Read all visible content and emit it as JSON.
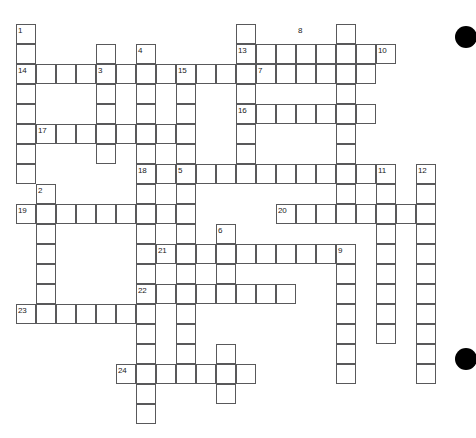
{
  "puzzle": {
    "title": "Crossword Grid",
    "cell_size": 20,
    "origin_x": 16,
    "origin_y": 24,
    "grid_color": "#59595b",
    "cell_fill": "#ffffff",
    "background": "#ffffff",
    "number_color": "#1a1a1a",
    "cols": 23,
    "rows": 20,
    "cells": [
      {
        "c": 1,
        "r": 1
      },
      {
        "c": 1,
        "r": 2
      },
      {
        "c": 1,
        "r": 3
      },
      {
        "c": 1,
        "r": 4
      },
      {
        "c": 1,
        "r": 5
      },
      {
        "c": 1,
        "r": 6
      },
      {
        "c": 1,
        "r": 7
      },
      {
        "c": 1,
        "r": 8
      },
      {
        "c": 2,
        "r": 3
      },
      {
        "c": 3,
        "r": 3
      },
      {
        "c": 4,
        "r": 3
      },
      {
        "c": 5,
        "r": 3
      },
      {
        "c": 6,
        "r": 3
      },
      {
        "c": 7,
        "r": 3
      },
      {
        "c": 8,
        "r": 3
      },
      {
        "c": 5,
        "r": 2
      },
      {
        "c": 5,
        "r": 4
      },
      {
        "c": 5,
        "r": 5
      },
      {
        "c": 5,
        "r": 6
      },
      {
        "c": 5,
        "r": 7
      },
      {
        "c": 7,
        "r": 2
      },
      {
        "c": 7,
        "r": 4
      },
      {
        "c": 7,
        "r": 5
      },
      {
        "c": 7,
        "r": 6
      },
      {
        "c": 7,
        "r": 7
      },
      {
        "c": 7,
        "r": 8
      },
      {
        "c": 7,
        "r": 9
      },
      {
        "c": 7,
        "r": 10
      },
      {
        "c": 7,
        "r": 11
      },
      {
        "c": 7,
        "r": 12
      },
      {
        "c": 7,
        "r": 13
      },
      {
        "c": 7,
        "r": 14
      },
      {
        "c": 7,
        "r": 15
      },
      {
        "c": 7,
        "r": 16
      },
      {
        "c": 7,
        "r": 17
      },
      {
        "c": 7,
        "r": 18
      },
      {
        "c": 7,
        "r": 19
      },
      {
        "c": 7,
        "r": 20
      },
      {
        "c": 2,
        "r": 6
      },
      {
        "c": 3,
        "r": 6
      },
      {
        "c": 4,
        "r": 6
      },
      {
        "c": 6,
        "r": 6
      },
      {
        "c": 8,
        "r": 6
      },
      {
        "c": 2,
        "r": 9
      },
      {
        "c": 2,
        "r": 10
      },
      {
        "c": 2,
        "r": 11
      },
      {
        "c": 2,
        "r": 12
      },
      {
        "c": 2,
        "r": 13
      },
      {
        "c": 2,
        "r": 14
      },
      {
        "c": 2,
        "r": 15
      },
      {
        "c": 1,
        "r": 10
      },
      {
        "c": 3,
        "r": 10
      },
      {
        "c": 4,
        "r": 10
      },
      {
        "c": 5,
        "r": 10
      },
      {
        "c": 6,
        "r": 10
      },
      {
        "c": 8,
        "r": 10
      },
      {
        "c": 9,
        "r": 10
      },
      {
        "c": 8,
        "r": 8
      },
      {
        "c": 9,
        "r": 8
      },
      {
        "c": 10,
        "r": 8
      },
      {
        "c": 11,
        "r": 8
      },
      {
        "c": 12,
        "r": 8
      },
      {
        "c": 13,
        "r": 8
      },
      {
        "c": 14,
        "r": 8
      },
      {
        "c": 15,
        "r": 8
      },
      {
        "c": 16,
        "r": 8
      },
      {
        "c": 17,
        "r": 8
      },
      {
        "c": 18,
        "r": 8
      },
      {
        "c": 9,
        "r": 9
      },
      {
        "c": 9,
        "r": 11
      },
      {
        "c": 9,
        "r": 12
      },
      {
        "c": 9,
        "r": 13
      },
      {
        "c": 9,
        "r": 14
      },
      {
        "c": 9,
        "r": 15
      },
      {
        "c": 9,
        "r": 16
      },
      {
        "c": 9,
        "r": 17
      },
      {
        "c": 9,
        "r": 18
      },
      {
        "c": 9,
        "r": 3
      },
      {
        "c": 10,
        "r": 3
      },
      {
        "c": 11,
        "r": 3
      },
      {
        "c": 12,
        "r": 3
      },
      {
        "c": 13,
        "r": 3
      },
      {
        "c": 14,
        "r": 3
      },
      {
        "c": 15,
        "r": 3
      },
      {
        "c": 16,
        "r": 3
      },
      {
        "c": 17,
        "r": 3
      },
      {
        "c": 18,
        "r": 3
      },
      {
        "c": 9,
        "r": 4
      },
      {
        "c": 9,
        "r": 5
      },
      {
        "c": 9,
        "r": 6
      },
      {
        "c": 9,
        "r": 7
      },
      {
        "c": 12,
        "r": 1
      },
      {
        "c": 12,
        "r": 2
      },
      {
        "c": 13,
        "r": 2
      },
      {
        "c": 14,
        "r": 2
      },
      {
        "c": 15,
        "r": 2
      },
      {
        "c": 16,
        "r": 2
      },
      {
        "c": 17,
        "r": 2
      },
      {
        "c": 18,
        "r": 2
      },
      {
        "c": 19,
        "r": 2
      },
      {
        "c": 12,
        "r": 4
      },
      {
        "c": 12,
        "r": 5
      },
      {
        "c": 12,
        "r": 6
      },
      {
        "c": 12,
        "r": 7
      },
      {
        "c": 13,
        "r": 5
      },
      {
        "c": 14,
        "r": 5
      },
      {
        "c": 15,
        "r": 5
      },
      {
        "c": 16,
        "r": 5
      },
      {
        "c": 17,
        "r": 5
      },
      {
        "c": 18,
        "r": 5
      },
      {
        "c": 17,
        "r": 1
      },
      {
        "c": 17,
        "r": 4
      },
      {
        "c": 17,
        "r": 6
      },
      {
        "c": 17,
        "r": 7
      },
      {
        "c": 17,
        "r": 9
      },
      {
        "c": 17,
        "r": 10
      },
      {
        "c": 19,
        "r": 8
      },
      {
        "c": 19,
        "r": 9
      },
      {
        "c": 19,
        "r": 10
      },
      {
        "c": 19,
        "r": 11
      },
      {
        "c": 19,
        "r": 12
      },
      {
        "c": 19,
        "r": 13
      },
      {
        "c": 19,
        "r": 14
      },
      {
        "c": 19,
        "r": 15
      },
      {
        "c": 19,
        "r": 16
      },
      {
        "c": 21,
        "r": 8
      },
      {
        "c": 21,
        "r": 9
      },
      {
        "c": 21,
        "r": 10
      },
      {
        "c": 21,
        "r": 11
      },
      {
        "c": 21,
        "r": 12
      },
      {
        "c": 21,
        "r": 13
      },
      {
        "c": 21,
        "r": 14
      },
      {
        "c": 21,
        "r": 15
      },
      {
        "c": 21,
        "r": 16
      },
      {
        "c": 21,
        "r": 17
      },
      {
        "c": 21,
        "r": 18
      },
      {
        "c": 14,
        "r": 10
      },
      {
        "c": 15,
        "r": 10
      },
      {
        "c": 16,
        "r": 10
      },
      {
        "c": 17,
        "r": 10
      },
      {
        "c": 18,
        "r": 10
      },
      {
        "c": 19,
        "r": 10
      },
      {
        "c": 20,
        "r": 10
      },
      {
        "c": 8,
        "r": 12
      },
      {
        "c": 10,
        "r": 12
      },
      {
        "c": 11,
        "r": 12
      },
      {
        "c": 12,
        "r": 12
      },
      {
        "c": 13,
        "r": 12
      },
      {
        "c": 14,
        "r": 12
      },
      {
        "c": 15,
        "r": 12
      },
      {
        "c": 16,
        "r": 12
      },
      {
        "c": 17,
        "r": 12
      },
      {
        "c": 11,
        "r": 11
      },
      {
        "c": 11,
        "r": 13
      },
      {
        "c": 17,
        "r": 13
      },
      {
        "c": 17,
        "r": 14
      },
      {
        "c": 17,
        "r": 15
      },
      {
        "c": 17,
        "r": 16
      },
      {
        "c": 17,
        "r": 17
      },
      {
        "c": 17,
        "r": 18
      },
      {
        "c": 7,
        "r": 14
      },
      {
        "c": 8,
        "r": 14
      },
      {
        "c": 10,
        "r": 14
      },
      {
        "c": 11,
        "r": 14
      },
      {
        "c": 12,
        "r": 14
      },
      {
        "c": 13,
        "r": 14
      },
      {
        "c": 14,
        "r": 14
      },
      {
        "c": 1,
        "r": 15
      },
      {
        "c": 3,
        "r": 15
      },
      {
        "c": 4,
        "r": 15
      },
      {
        "c": 5,
        "r": 15
      },
      {
        "c": 6,
        "r": 15
      },
      {
        "c": 6,
        "r": 18
      },
      {
        "c": 7,
        "r": 18
      },
      {
        "c": 8,
        "r": 18
      },
      {
        "c": 9,
        "r": 18
      },
      {
        "c": 10,
        "r": 18
      },
      {
        "c": 11,
        "r": 18
      },
      {
        "c": 12,
        "r": 18
      },
      {
        "c": 11,
        "r": 17
      },
      {
        "c": 11,
        "r": 19
      }
    ],
    "numbers": [
      {
        "n": "1",
        "c": 1,
        "r": 1
      },
      {
        "n": "2",
        "c": 2,
        "r": 9
      },
      {
        "n": "3",
        "c": 5,
        "r": 3
      },
      {
        "n": "4",
        "c": 7,
        "r": 2
      },
      {
        "n": "5",
        "c": 9,
        "r": 8
      },
      {
        "n": "6",
        "c": 11,
        "r": 11
      },
      {
        "n": "7",
        "c": 13,
        "r": 3
      },
      {
        "n": "8",
        "c": 15,
        "r": 1
      },
      {
        "n": "9",
        "c": 17,
        "r": 12
      },
      {
        "n": "10",
        "c": 19,
        "r": 2
      },
      {
        "n": "11",
        "c": 19,
        "r": 8
      },
      {
        "n": "12",
        "c": 21,
        "r": 8
      },
      {
        "n": "13",
        "c": 12,
        "r": 2
      },
      {
        "n": "14",
        "c": 1,
        "r": 3
      },
      {
        "n": "15",
        "c": 9,
        "r": 3
      },
      {
        "n": "16",
        "c": 12,
        "r": 5
      },
      {
        "n": "17",
        "c": 2,
        "r": 6
      },
      {
        "n": "18",
        "c": 7,
        "r": 8
      },
      {
        "n": "19",
        "c": 1,
        "r": 10
      },
      {
        "n": "20",
        "c": 14,
        "r": 10
      },
      {
        "n": "21",
        "c": 8,
        "r": 12
      },
      {
        "n": "22",
        "c": 7,
        "r": 14
      },
      {
        "n": "23",
        "c": 1,
        "r": 15
      },
      {
        "n": "24",
        "c": 6,
        "r": 18
      }
    ],
    "decorations": [
      {
        "name": "page-dot-top-right",
        "x": 455,
        "y": 26,
        "size": 22
      },
      {
        "name": "page-dot-bottom-right",
        "x": 455,
        "y": 348,
        "size": 22
      }
    ]
  }
}
